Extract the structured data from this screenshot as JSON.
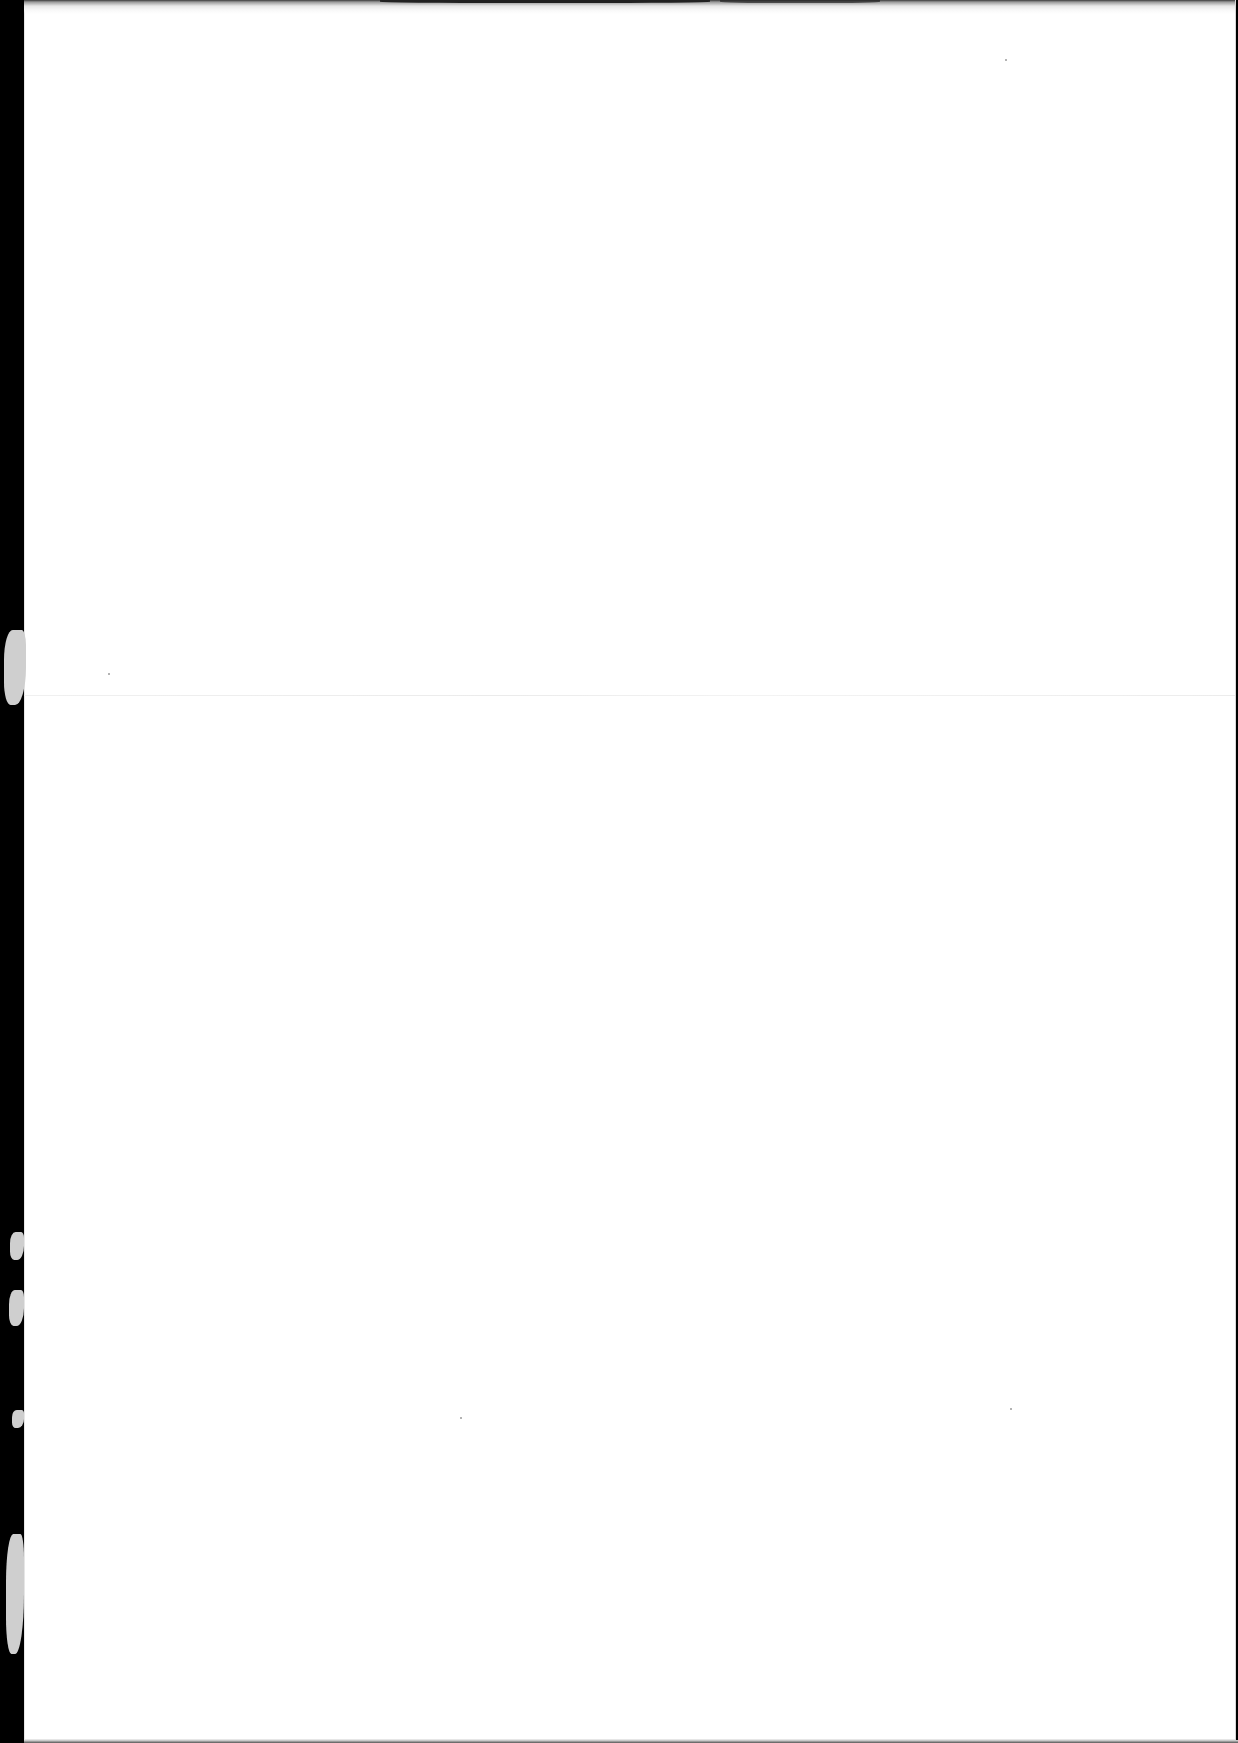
{
  "document": {
    "type": "scanned-page",
    "content": "blank",
    "text_blocks": []
  },
  "colors": {
    "scanner_background": "#000000",
    "paper": "#ffffff",
    "fold_line": "#ececec",
    "edge_shadow": "#555555",
    "torn_edge": "#cfcfcf"
  },
  "layout": {
    "paper_left_px": 24,
    "fold_y_px": 695,
    "torn_edge_regions_y": [
      [
        628,
        708
      ],
      [
        1229,
        1262
      ],
      [
        1289,
        1330
      ],
      [
        1410,
        1430
      ],
      [
        1533,
        1660
      ]
    ],
    "specks": [
      [
        108,
        673
      ],
      [
        1010,
        59
      ],
      [
        1010,
        1408
      ],
      [
        460,
        1417
      ]
    ]
  }
}
